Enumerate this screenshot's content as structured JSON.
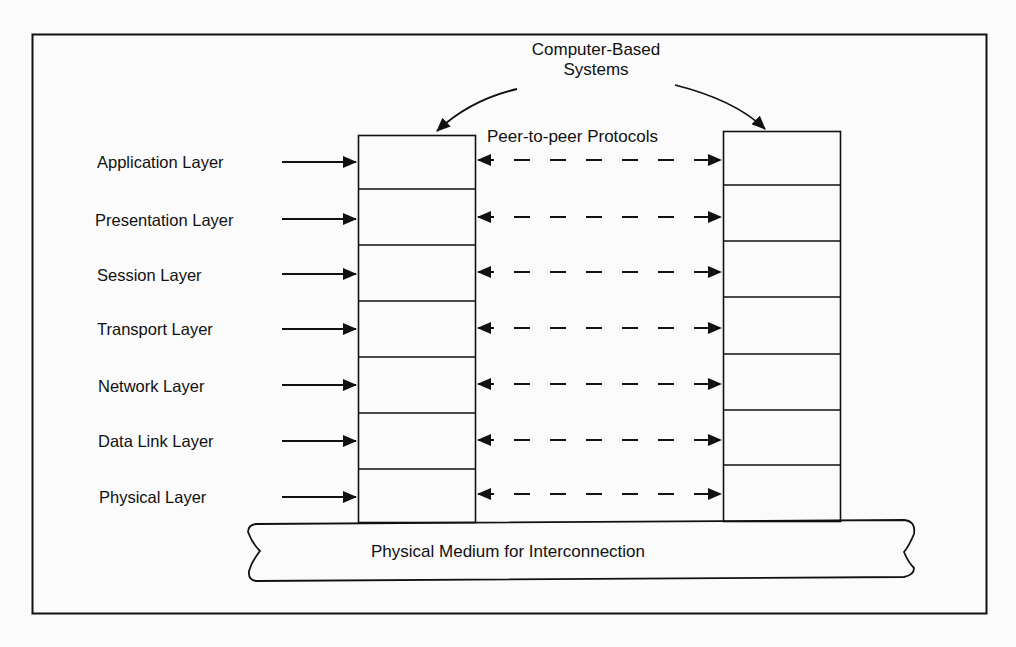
{
  "diagram": {
    "type": "osi-reference-model",
    "top_label": {
      "line1": "Computer-Based",
      "line2": "Systems"
    },
    "protocol_label": "Peer-to-peer Protocols",
    "medium_label": "Physical Medium for Interconnection",
    "layers": [
      {
        "label": "Application Layer"
      },
      {
        "label": "Presentation Layer"
      },
      {
        "label": "Session Layer"
      },
      {
        "label": "Transport Layer"
      },
      {
        "label": "Network Layer"
      },
      {
        "label": "Data Link Layer"
      },
      {
        "label": "Physical Layer"
      }
    ],
    "nodes": [
      {
        "id": "left-system",
        "layers": 7
      },
      {
        "id": "right-system",
        "layers": 7
      }
    ],
    "edges": [
      {
        "from": "Application Layer",
        "to": "left-system.layer-1",
        "style": "solid-arrow"
      },
      {
        "from": "Presentation Layer",
        "to": "left-system.layer-2",
        "style": "solid-arrow"
      },
      {
        "from": "Session Layer",
        "to": "left-system.layer-3",
        "style": "solid-arrow"
      },
      {
        "from": "Transport Layer",
        "to": "left-system.layer-4",
        "style": "solid-arrow"
      },
      {
        "from": "Network Layer",
        "to": "left-system.layer-5",
        "style": "solid-arrow"
      },
      {
        "from": "Data Link Layer",
        "to": "left-system.layer-6",
        "style": "solid-arrow"
      },
      {
        "from": "Physical Layer",
        "to": "left-system.layer-7",
        "style": "solid-arrow"
      },
      {
        "from": "left-system.layer-1",
        "to": "right-system.layer-1",
        "style": "dashed-bidirectional"
      },
      {
        "from": "left-system.layer-2",
        "to": "right-system.layer-2",
        "style": "dashed-bidirectional"
      },
      {
        "from": "left-system.layer-3",
        "to": "right-system.layer-3",
        "style": "dashed-bidirectional"
      },
      {
        "from": "left-system.layer-4",
        "to": "right-system.layer-4",
        "style": "dashed-bidirectional"
      },
      {
        "from": "left-system.layer-5",
        "to": "right-system.layer-5",
        "style": "dashed-bidirectional"
      },
      {
        "from": "left-system.layer-6",
        "to": "right-system.layer-6",
        "style": "dashed-bidirectional"
      },
      {
        "from": "left-system.layer-7",
        "to": "right-system.layer-7",
        "style": "dashed-bidirectional"
      },
      {
        "from": "Computer-Based Systems",
        "to": "left-system",
        "style": "curved-arrow"
      },
      {
        "from": "Computer-Based Systems",
        "to": "right-system",
        "style": "curved-arrow"
      },
      {
        "from": "left-system",
        "to": "Physical Medium for Interconnection",
        "style": "attached"
      },
      {
        "from": "right-system",
        "to": "Physical Medium for Interconnection",
        "style": "attached"
      }
    ],
    "colors": {
      "ink": "#111111",
      "background": "#fbfbfb"
    }
  }
}
